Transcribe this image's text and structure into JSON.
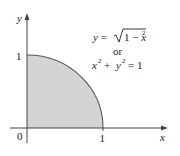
{
  "diagram": {
    "type": "quarter-circle-region",
    "axes": {
      "x_label": "x",
      "y_label": "y",
      "origin_label": "0",
      "x_tick_label": "1",
      "y_tick_label": "1"
    },
    "equation": {
      "line1_lhs": "y = ",
      "line1_radicand_a": "1 − ",
      "line1_radicand_var": "x",
      "line1_radicand_exp": "2",
      "or_label": "or",
      "line3_a": "x",
      "line3_a_exp": "2",
      "line3_plus": " + ",
      "line3_b": "y",
      "line3_b_exp": "2",
      "line3_rhs": " = 1"
    },
    "colors": {
      "fill": "#d4d4d4",
      "stroke": "#555555",
      "axis": "#444444"
    }
  }
}
